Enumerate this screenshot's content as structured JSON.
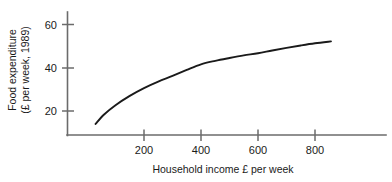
{
  "chart_data": {
    "type": "line",
    "title": "",
    "xlabel": "Household income £ per week",
    "ylabel_line1": "Food expenditure",
    "ylabel_line2": "(£ per week, 1989)",
    "ylabel": "Food expenditure (£ per week, 1989)",
    "grid": false,
    "legend": false,
    "xlim": [
      0,
      1000
    ],
    "ylim": [
      8,
      68
    ],
    "xticks": [
      200,
      400,
      600,
      800
    ],
    "xtick_labels": [
      "200",
      "400",
      "600",
      "800"
    ],
    "yticks": [
      20,
      40,
      60
    ],
    "ytick_labels": [
      "20",
      "40",
      "60"
    ],
    "series": [
      {
        "name": "Food expenditure vs household income",
        "x": [
          30,
          60,
          100,
          150,
          200,
          250,
          300,
          350,
          400,
          450,
          500,
          550,
          600,
          650,
          700,
          750,
          800,
          856
        ],
        "y": [
          14.0,
          18.4,
          22.7,
          27.0,
          30.6,
          33.6,
          36.2,
          39.0,
          41.6,
          43.2,
          44.5,
          45.7,
          46.7,
          48.0,
          49.2,
          50.3,
          51.3,
          52.2
        ]
      }
    ],
    "curve_color": "#1a1a1a",
    "axis_color": "#6b6b6b",
    "background_color": "#ffffff"
  }
}
